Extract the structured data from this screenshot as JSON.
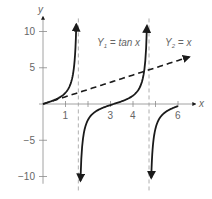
{
  "chart_data": {
    "type": "line",
    "title": "",
    "xlabel": "x",
    "ylabel": "y",
    "xlim": [
      0,
      6.6
    ],
    "ylim": [
      -11,
      11.5
    ],
    "x_ticks": [
      1,
      2,
      3,
      4,
      5,
      6
    ],
    "x_tick_labels": [
      {
        "value": 1,
        "label": "1"
      },
      {
        "value": 3,
        "label": "3"
      },
      {
        "value": 4,
        "label": "4"
      },
      {
        "value": 6,
        "label": "6"
      }
    ],
    "y_ticks": [
      {
        "value": 10,
        "label": "10"
      },
      {
        "value": 5,
        "label": "5"
      },
      {
        "value": -5,
        "label": "−5"
      },
      {
        "value": -10,
        "label": "−10"
      }
    ],
    "asymptotes": [
      1.5708,
      4.7124
    ],
    "series": [
      {
        "name": "Y1 = tan x",
        "label_main": "Y",
        "label_sub": "1",
        "label_rest": " = tan x",
        "function": "tan",
        "style": "solid",
        "branches": [
          [
            0,
            1.48
          ],
          [
            1.665,
            4.62
          ],
          [
            4.81,
            6.0
          ]
        ]
      },
      {
        "name": "Y2 = x",
        "label_main": "Y",
        "label_sub": "2",
        "label_rest": " = x",
        "function": "identity",
        "style": "dashed",
        "branches": [
          [
            0,
            6.5
          ]
        ]
      }
    ],
    "grid": false,
    "legend": "inline"
  }
}
